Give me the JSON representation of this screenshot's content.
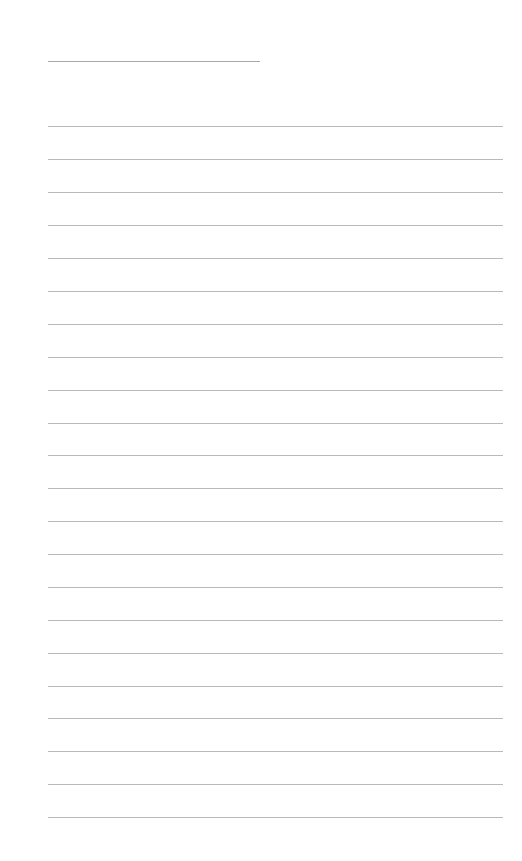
{
  "page": {
    "type": "lined-paper",
    "header_line": {
      "left": 48,
      "top": 61,
      "width": 212
    },
    "ruled_lines": {
      "left": 48,
      "width": 455,
      "tops": [
        126,
        159,
        192,
        225,
        258,
        291,
        324,
        357,
        390,
        423,
        455,
        488,
        521,
        554,
        587,
        620,
        653,
        686,
        718,
        751,
        784,
        817
      ]
    },
    "colors": {
      "background": "#ffffff",
      "line": "#b9b9b9",
      "header_line": "#a9a9a9"
    }
  }
}
